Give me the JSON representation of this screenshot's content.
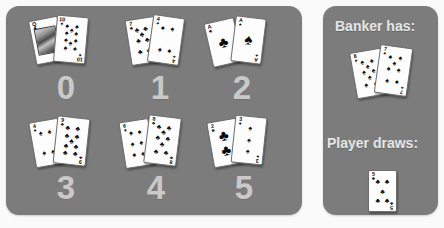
{
  "theme": {
    "panel_color": "#7c7c7c",
    "label_color": "#c9c9c9",
    "text_color": "#e6e6e6",
    "card_face": "#fdfdfd",
    "pip_color": "#0a0a0a",
    "page_background": "#fafafa"
  },
  "left_panel": {
    "name": "baccarat-banker-hand-chart",
    "hands": [
      {
        "label": "0",
        "total": 0,
        "cards": [
          {
            "rank": "Q",
            "suit": "clubs",
            "suit_glyph": "♣",
            "face": true
          },
          {
            "rank": "10",
            "suit": "spades",
            "suit_glyph": "♠",
            "face": false,
            "pips": 10
          }
        ]
      },
      {
        "label": "1",
        "total": 1,
        "cards": [
          {
            "rank": "7",
            "suit": "clubs",
            "suit_glyph": "♣",
            "face": false,
            "pips": 7
          },
          {
            "rank": "4",
            "suit": "spades",
            "suit_glyph": "♠",
            "face": false,
            "pips": 4
          }
        ]
      },
      {
        "label": "2",
        "total": 2,
        "cards": [
          {
            "rank": "A",
            "suit": "clubs",
            "suit_glyph": "♣",
            "face": false,
            "pips": 1
          },
          {
            "rank": "A",
            "suit": "spades",
            "suit_glyph": "♠",
            "face": false,
            "pips": 1
          }
        ]
      },
      {
        "label": "3",
        "total": 3,
        "cards": [
          {
            "rank": "4",
            "suit": "spades",
            "suit_glyph": "♠",
            "face": false,
            "pips": 4
          },
          {
            "rank": "9",
            "suit": "clubs",
            "suit_glyph": "♣",
            "face": false,
            "pips": 9
          }
        ]
      },
      {
        "label": "4",
        "total": 4,
        "cards": [
          {
            "rank": "6",
            "suit": "spades",
            "suit_glyph": "♠",
            "face": false,
            "pips": 6
          },
          {
            "rank": "8",
            "suit": "clubs",
            "suit_glyph": "♣",
            "face": false,
            "pips": 8
          }
        ]
      },
      {
        "label": "5",
        "total": 5,
        "cards": [
          {
            "rank": "2",
            "suit": "clubs",
            "suit_glyph": "♣",
            "face": false,
            "pips": 2
          },
          {
            "rank": "3",
            "suit": "spades",
            "suit_glyph": "♠",
            "face": false,
            "pips": 3
          }
        ]
      }
    ]
  },
  "right_panel": {
    "banker": {
      "label": "Banker has:",
      "cards": [
        {
          "rank": "8",
          "suit": "spades",
          "suit_glyph": "♠",
          "pips": 8
        },
        {
          "rank": "7",
          "suit": "spades",
          "suit_glyph": "♠",
          "pips": 7
        }
      ]
    },
    "player": {
      "label": "Player draws:",
      "cards": [
        {
          "rank": "5",
          "suit": "clubs",
          "suit_glyph": "♣",
          "pips": 5
        }
      ]
    }
  }
}
